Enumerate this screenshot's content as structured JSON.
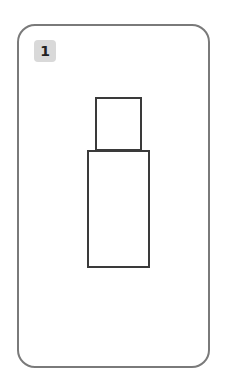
{
  "card": {
    "number": "1",
    "border_color": "#7a7a7a",
    "badge_color": "#d9d9d9"
  },
  "drawing": {
    "shapes": [
      {
        "name": "upper-rectangle",
        "x": 95,
        "y": 97,
        "w": 47,
        "h": 54
      },
      {
        "name": "lower-rectangle",
        "x": 87,
        "y": 150,
        "w": 63,
        "h": 118
      }
    ],
    "stroke_color": "#3a3a3a"
  }
}
